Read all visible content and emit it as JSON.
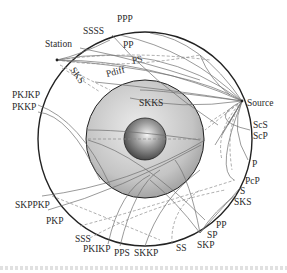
{
  "diagram": {
    "center": [
      145,
      139
    ],
    "mantle_radius": 107,
    "outer_core_radius": 59,
    "inner_core_radius": 21,
    "colors": {
      "outline": "#222222",
      "ray": "#6e6e6e",
      "ray_dashed": "#8a8a8a",
      "outer_core_light": "#e6e6e6",
      "outer_core_dark": "#9a9a9a",
      "inner_core_light": "#f4f4f4",
      "inner_core_dark": "#3c3c3c",
      "label": "#2a2a2a"
    },
    "source": {
      "label": "Source",
      "point": [
        242,
        101
      ]
    },
    "station": {
      "label": "Station",
      "point": [
        57,
        60
      ]
    },
    "labels": [
      {
        "id": "ppp",
        "text": "PPP",
        "x": 117,
        "y": 22
      },
      {
        "id": "ssss",
        "text": "SSSS",
        "x": 83,
        "y": 34
      },
      {
        "id": "station",
        "text": "Station",
        "x": 45,
        "y": 47
      },
      {
        "id": "pp-top",
        "text": "PP",
        "x": 123,
        "y": 48
      },
      {
        "id": "sks-top",
        "text": "SKS",
        "x": 70,
        "y": 70,
        "rotate": 55
      },
      {
        "id": "pdiff",
        "text": "Pdiff",
        "x": 107,
        "y": 77,
        "rotate": -15
      },
      {
        "id": "ps",
        "text": "PS",
        "x": 133,
        "y": 64,
        "rotate": -15
      },
      {
        "id": "pkjkp",
        "text": "PKJKP",
        "x": 12,
        "y": 98
      },
      {
        "id": "pkkp",
        "text": "PKKP",
        "x": 12,
        "y": 110
      },
      {
        "id": "skks",
        "text": "SKKS",
        "x": 139,
        "y": 106
      },
      {
        "id": "source",
        "text": "Source",
        "x": 247,
        "y": 106
      },
      {
        "id": "scs",
        "text": "ScS",
        "x": 253,
        "y": 128
      },
      {
        "id": "scp",
        "text": "ScP",
        "x": 253,
        "y": 139
      },
      {
        "id": "p",
        "text": "P",
        "x": 252,
        "y": 167
      },
      {
        "id": "pcp",
        "text": "PcP",
        "x": 245,
        "y": 184
      },
      {
        "id": "s",
        "text": "S",
        "x": 240,
        "y": 194
      },
      {
        "id": "sks-bottom",
        "text": "SKS",
        "x": 234,
        "y": 205
      },
      {
        "id": "skppkp",
        "text": "SKPPKP",
        "x": 15,
        "y": 208
      },
      {
        "id": "pkp",
        "text": "PKP",
        "x": 46,
        "y": 224
      },
      {
        "id": "pp-bottom",
        "text": "PP",
        "x": 216,
        "y": 228
      },
      {
        "id": "sp",
        "text": "SP",
        "x": 207,
        "y": 238
      },
      {
        "id": "sss",
        "text": "SSS",
        "x": 75,
        "y": 242
      },
      {
        "id": "pkikp",
        "text": "PKIKP",
        "x": 83,
        "y": 252
      },
      {
        "id": "pps",
        "text": "PPS",
        "x": 114,
        "y": 256
      },
      {
        "id": "skkp",
        "text": "SKKP",
        "x": 134,
        "y": 256
      },
      {
        "id": "ss",
        "text": "SS",
        "x": 176,
        "y": 251
      },
      {
        "id": "skp",
        "text": "SKP",
        "x": 197,
        "y": 248
      }
    ],
    "rays_solid": [
      "M242,101 Q150,60 57,60",
      "M242,101 Q160,40 57,60",
      "M242,101 Q190,50 120,35",
      "M242,101 Q200,40 150,33",
      "M242,101 Q190,70 57,60",
      "M242,101 Q175,90 95,82",
      "M242,101 Q180,110 130,98",
      "M242,101 Q160,90 140,90",
      "M242,101 L228,125",
      "M242,101 L222,135",
      "M242,101 L215,145",
      "M242,101 Q215,170 234,180",
      "M242,101 Q230,130 248,160",
      "M242,101 Q205,120 250,130",
      "M38,105 Q80,120 110,185",
      "M38,112 Q70,115 100,180",
      "M88,140 Q140,155 205,220",
      "M88,130 Q130,130 200,140",
      "M42,196 Q130,185 205,140",
      "M48,210 Q120,190 201,145",
      "M108,244 Q120,190 150,175",
      "M120,246 Q135,185 160,170",
      "M200,233 Q190,180 175,160",
      "M200,233 Q215,210 236,195",
      "M200,233 Q225,205 240,188",
      "M200,233 Q175,200 150,180",
      "M145,246 Q160,200 200,170",
      "M112,35 Q150,80 218,125",
      "M80,48 Q140,60 200,80",
      "M57,60 Q80,55 110,40",
      "M200,55 Q210,80 230,95"
    ],
    "rays_dashed": [
      "M57,60 Q130,50 210,60",
      "M57,60 Q120,70 200,55",
      "M60,65 Q90,80 110,90",
      "M62,68 Q85,82 100,92",
      "M242,101 Q225,125 232,170",
      "M242,101 Q215,130 222,160",
      "M242,101 L205,130",
      "M242,101 L210,122",
      "M80,226 Q140,210 235,180",
      "M90,238 Q150,205 225,190",
      "M172,244 Q170,210 200,190",
      "M52,196 Q100,215 160,240",
      "M88,139 L202,139"
    ]
  }
}
